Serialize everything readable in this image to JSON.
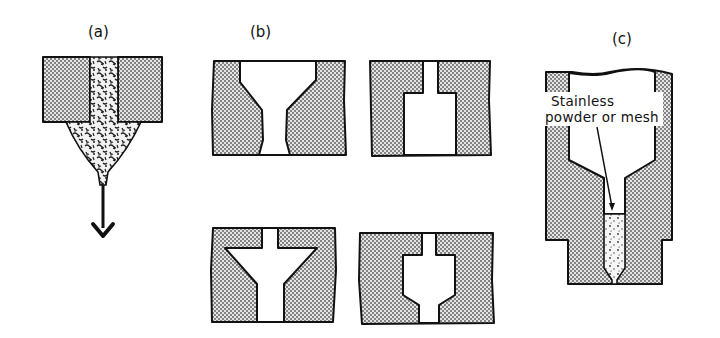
{
  "figure": {
    "panels": [
      {
        "id": "a",
        "label": "(a)",
        "description": "Nozzle with melt stream flowing downward"
      },
      {
        "id": "b",
        "label": "(b)",
        "description": "Four nozzle bore geometries",
        "variants": [
          "converging-diverging",
          "stepped-expansion",
          "cone-funnel",
          "stepped-taper"
        ]
      },
      {
        "id": "c",
        "label": "(c)",
        "description": "Nozzle with filter insert",
        "annotation_line1": "Stainless",
        "annotation_line2": "powder or mesh"
      }
    ],
    "colors": {
      "ink": "#111111",
      "background": "#ffffff",
      "stipple": "#555555"
    }
  }
}
